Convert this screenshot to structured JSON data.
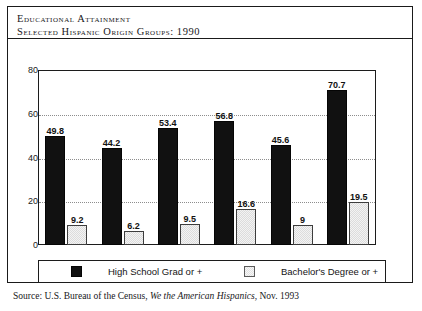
{
  "caption": {
    "line1": "Educational Attainment",
    "line2": "Selected Hispanic Origin Groups: 1990"
  },
  "source": {
    "prefix": "Source: U.S. Bureau of the Census, ",
    "title_italic": "We the American Hispanics",
    "suffix": ", Nov. 1993"
  },
  "legend": {
    "series1": "High School Grad or +",
    "series2": "Bachelor's Degree or +"
  },
  "chart_data": {
    "type": "bar",
    "xlabel": "",
    "ylabel": "",
    "ylim": [
      0,
      80
    ],
    "yticks": [
      "0",
      "20",
      "40",
      "60",
      "80"
    ],
    "grid": true,
    "grid_orientation": "horizontal",
    "legend_position": "bottom",
    "categories": [
      "",
      "",
      "",
      "",
      "",
      ""
    ],
    "series": [
      {
        "name": "High School Grad or +",
        "color": "#111111",
        "values": [
          49.8,
          44.2,
          53.4,
          56.8,
          45.6,
          70.7
        ],
        "labels": [
          "49.8",
          "44.2",
          "53.4",
          "56.8",
          "45.6",
          "70.7"
        ]
      },
      {
        "name": "Bachelor's Degree or +",
        "color": "#dcdcdc",
        "values": [
          9.2,
          6.2,
          9.5,
          16.6,
          9,
          19.5
        ],
        "labels": [
          "9.2",
          "6.2",
          "9.5",
          "16.6",
          "9",
          "19.5"
        ]
      }
    ]
  }
}
